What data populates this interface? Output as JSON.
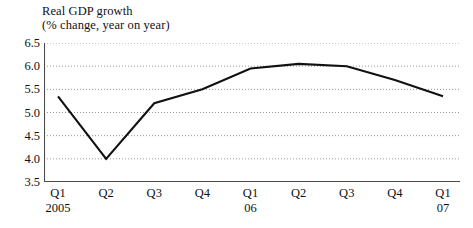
{
  "chart_data": {
    "type": "line",
    "title": "Real GDP growth",
    "subtitle": "(% change, year on year)",
    "xlabel": "",
    "ylabel": "",
    "ylim": [
      3.5,
      6.5
    ],
    "ytick_step": 0.5,
    "grid": true,
    "legend": "none",
    "line_color": "#111111",
    "categories": [
      "Q1",
      "Q2",
      "Q3",
      "Q4",
      "Q1",
      "Q2",
      "Q3",
      "Q4",
      "Q1"
    ],
    "category_years": [
      "2005",
      "",
      "",
      "",
      "06",
      "",
      "",
      "",
      "07"
    ],
    "values": [
      5.35,
      4.0,
      5.2,
      5.5,
      5.95,
      6.05,
      6.0,
      5.7,
      5.35
    ],
    "ytick_labels": [
      "6.5",
      "6.0",
      "5.5",
      "5.0",
      "4.5",
      "4.0",
      "3.5"
    ],
    "ytick_values": [
      6.5,
      6.0,
      5.5,
      5.0,
      4.5,
      4.0,
      3.5
    ]
  }
}
